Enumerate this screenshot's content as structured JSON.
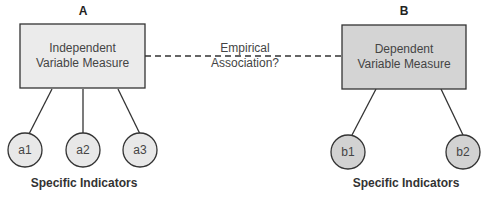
{
  "diagram": {
    "association_label": [
      "Empirical",
      "Association?"
    ],
    "colors": {
      "box_a_fill": "#ebebeb",
      "box_b_fill": "#d4d4d4",
      "circle_a_fill": "#e8e8e8",
      "circle_b_fill": "#d2d2d2",
      "stroke": "#333333"
    },
    "left": {
      "letter": "A",
      "box_label": [
        "Independent",
        "Variable Measure"
      ],
      "indicators": [
        "a1",
        "a2",
        "a3"
      ],
      "indicators_caption": "Specific Indicators"
    },
    "right": {
      "letter": "B",
      "box_label": [
        "Dependent",
        "Variable Measure"
      ],
      "indicators": [
        "b1",
        "b2"
      ],
      "indicators_caption": "Specific Indicators"
    }
  }
}
